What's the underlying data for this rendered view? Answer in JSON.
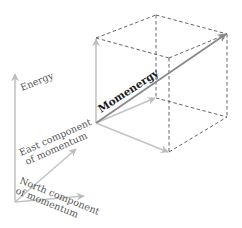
{
  "diagram": {
    "type": "3d-vector-decomposition",
    "labels": {
      "energy": "Energy",
      "east_line1": "East component",
      "east_line2": "of momentum",
      "north_line1": "North component",
      "north_line2": "of momentum",
      "momenergy": "Momenergy"
    },
    "colors": {
      "axis_arrow": "#b8b8b8",
      "momenergy_arrow": "#8a8a8a",
      "cube_edges": "#555555",
      "label_text": "#555555",
      "bold_label": "#1a1a1a",
      "background": "#ffffff"
    }
  }
}
